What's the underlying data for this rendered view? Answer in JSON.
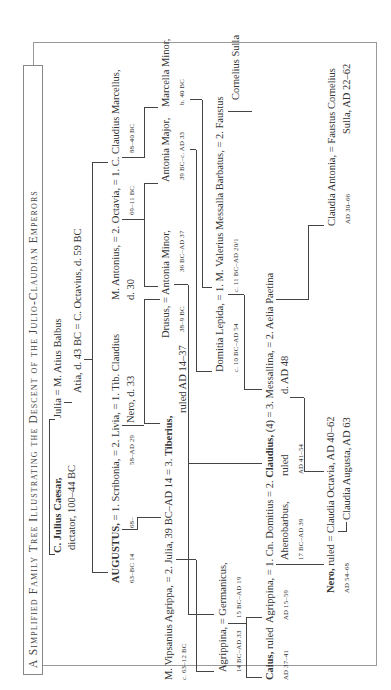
{
  "title": "A Simplified Family Tree Illustrating the Descent of the Julio-Claudian Emperors",
  "people": {
    "caesar": {
      "name": "C. Julius Caesar,",
      "detail": "dictator, 100–44 BC"
    },
    "julia_balbus": "Julia = M. Atius Balbus",
    "atia": "Atia, d. 43 BC = C. Octavius, d. 59 BC",
    "augustus_line": {
      "augustus": "AUGUSTUS,",
      "rest": " = 1. Scribonia, = 2. Livia, = 1. Tib. Claudius",
      "augustus_dates": "63–BC 14",
      "scribonia_dates": "68–",
      "livia_dates": "58–AD 29",
      "nero_claudius": "Nero, d. 33"
    },
    "antonius_line": {
      "text": "M. Antonius, = 2. Octavia, = 1. C. Claudius Marcellus,",
      "antonius_dates": "d. 30",
      "octavia_dates": "69–11 BC",
      "marcellus_dates": "88–40 BC"
    },
    "agrippa_line": {
      "text_a": "M. Vipsanius Agrippa, = 2. Julia, 39 BC–AD 14 = 3. ",
      "tiberius": "Tiberius,",
      "agrippa_dates": "c. 63–12 BC",
      "tiberius_dates": "ruled AD 14–37"
    },
    "drusus_line": {
      "text": "Drusus, = Antonia Minor,",
      "drusus_dates": "38–9 BC",
      "antonia_minor_dates": "36 BC–AD 37"
    },
    "antonia_major": {
      "name": "Antonia Major,",
      "dates": "39 BC–c. AD 33"
    },
    "marcella_minor": {
      "name": "Marcella Minor,",
      "dates": "b. 40 BC"
    },
    "agrippina_elder": {
      "text": "Agrippina, = Germanicus,",
      "agrippina_dates": "14 BC–AD 33",
      "germanicus_dates": "15 BC–AD 19"
    },
    "domitia_line": {
      "text": "Domitia Lepida, = 1. M. Valerius Messalla Barbatus, = 2. Faustus",
      "domitia_dates": "c. 10 BC–AD 54",
      "messalla_dates": "c. 11 BC–AD 20/1",
      "faustus_rest": "Cornelius Sulla"
    },
    "caius": {
      "name": "Caius,",
      "rest": " ruled",
      "dates": "AD 37–41"
    },
    "claudius_line": {
      "text_a": "Agrippina, = 1. Cn. Domitius = 2. ",
      "claudius": "Claudius,",
      "text_b": " (4) = 3. Messallina, = 2. Aelia Paetina",
      "agrippina_dates": "AD 15–59",
      "ahenobarbus": "Ahenobarbus,",
      "ahenobarbus_dates": "17 BC–AD 39",
      "claudius_ruled": "ruled",
      "claudius_dates": "AD 41–54",
      "messallina_dates": "d. AD 48"
    },
    "claudia_antonia": {
      "text": "Claudia Antonia, = Faustus Cornelius",
      "dates": "AD 30–66",
      "sulla": "Sulla, AD 22–62"
    },
    "nero_line": {
      "nero": "Nero,",
      "text": " ruled = Claudia Octavia, AD 40–62",
      "dates": "AD 54–68",
      "claudia_augusta": "Claudia Augusta, AD 63"
    }
  }
}
